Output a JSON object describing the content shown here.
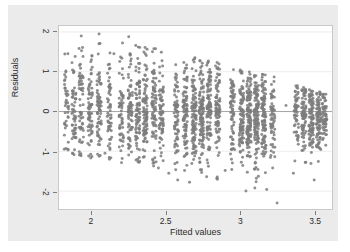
{
  "chart_data": {
    "type": "scatter",
    "title": "",
    "subtitle": "",
    "xlabel": "Fitted values",
    "ylabel": "Residuals",
    "xlim": [
      1.78,
      3.62
    ],
    "ylim": [
      -2.45,
      2.15
    ],
    "xticks": [
      2,
      2.5,
      3,
      3.5
    ],
    "xtick_labels": [
      "2",
      "2.5",
      "3",
      "3.5"
    ],
    "yticks": [
      2,
      1,
      0,
      -1,
      -2
    ],
    "ytick_labels": [
      "2",
      "1",
      "0",
      "-1",
      "-2"
    ],
    "grid": true,
    "grid_axis": "y",
    "legend": "none",
    "marker": {
      "shape": "circle",
      "color": "#7d7d7d",
      "size": 3.0,
      "opacity": 0.85
    },
    "reference_lines": [
      {
        "orientation": "horizontal",
        "value": 0,
        "color": "#9a9a9a"
      }
    ],
    "annotations": [
      "Residual spread fans downward: upper envelope declines from about 1.9 at fitted 2.0 to about 0.6 at fitted 3.55",
      "Points form discrete vertical bands at repeated fitted values",
      "Density is highest near residual 0; sparse outliers reach about -2.3"
    ],
    "n_points": 1850,
    "bands": [
      {
        "x": 1.83,
        "n": 40,
        "top": 1.55,
        "bottom": -1.05
      },
      {
        "x": 1.88,
        "n": 55,
        "top": 1.6,
        "bottom": -1.1
      },
      {
        "x": 1.93,
        "n": 60,
        "top": 1.7,
        "bottom": -1.15
      },
      {
        "x": 1.99,
        "n": 70,
        "top": 1.75,
        "bottom": -1.2
      },
      {
        "x": 2.05,
        "n": 70,
        "top": 1.8,
        "bottom": -1.2
      },
      {
        "x": 2.12,
        "n": 55,
        "top": 1.55,
        "bottom": -1.25
      },
      {
        "x": 2.2,
        "n": 60,
        "top": 1.8,
        "bottom": -1.3
      },
      {
        "x": 2.26,
        "n": 75,
        "top": 1.75,
        "bottom": -1.3
      },
      {
        "x": 2.31,
        "n": 85,
        "top": 1.7,
        "bottom": -1.35
      },
      {
        "x": 2.36,
        "n": 90,
        "top": 1.65,
        "bottom": -1.35
      },
      {
        "x": 2.42,
        "n": 80,
        "top": 1.6,
        "bottom": -1.4
      },
      {
        "x": 2.47,
        "n": 70,
        "top": 1.55,
        "bottom": -1.45
      },
      {
        "x": 2.57,
        "n": 75,
        "top": 1.45,
        "bottom": -1.5
      },
      {
        "x": 2.63,
        "n": 95,
        "top": 1.45,
        "bottom": -1.55
      },
      {
        "x": 2.69,
        "n": 110,
        "top": 1.4,
        "bottom": -1.6
      },
      {
        "x": 2.74,
        "n": 115,
        "top": 1.35,
        "bottom": -1.65
      },
      {
        "x": 2.79,
        "n": 105,
        "top": 1.3,
        "bottom": -1.7
      },
      {
        "x": 2.85,
        "n": 90,
        "top": 1.25,
        "bottom": -1.75
      },
      {
        "x": 2.95,
        "n": 70,
        "top": 1.15,
        "bottom": -1.55
      },
      {
        "x": 3.01,
        "n": 95,
        "top": 1.05,
        "bottom": -1.6
      },
      {
        "x": 3.06,
        "n": 120,
        "top": 1.0,
        "bottom": -1.75
      },
      {
        "x": 3.11,
        "n": 120,
        "top": 0.98,
        "bottom": -1.8
      },
      {
        "x": 3.16,
        "n": 100,
        "top": 0.95,
        "bottom": -1.7
      },
      {
        "x": 3.22,
        "n": 60,
        "top": 0.9,
        "bottom": -1.6
      },
      {
        "x": 3.38,
        "n": 55,
        "top": 0.68,
        "bottom": -1.3
      },
      {
        "x": 3.43,
        "n": 80,
        "top": 0.62,
        "bottom": -1.35
      },
      {
        "x": 3.48,
        "n": 95,
        "top": 0.58,
        "bottom": -1.4
      },
      {
        "x": 3.53,
        "n": 90,
        "top": 0.52,
        "bottom": -1.35
      },
      {
        "x": 3.57,
        "n": 60,
        "top": 0.45,
        "bottom": -1.2
      }
    ],
    "outliers": [
      {
        "x": 1.84,
        "y": 1.45
      },
      {
        "x": 1.93,
        "y": 1.9
      },
      {
        "x": 2.05,
        "y": 1.95
      },
      {
        "x": 2.09,
        "y": -1.05
      },
      {
        "x": 2.15,
        "y": 1.45
      },
      {
        "x": 2.25,
        "y": 1.88
      },
      {
        "x": 2.45,
        "y": -1.42
      },
      {
        "x": 2.52,
        "y": -1.55
      },
      {
        "x": 2.58,
        "y": -1.72
      },
      {
        "x": 2.66,
        "y": -1.78
      },
      {
        "x": 2.9,
        "y": -1.48
      },
      {
        "x": 3.04,
        "y": -2.0
      },
      {
        "x": 3.1,
        "y": -1.92
      },
      {
        "x": 3.18,
        "y": -1.96
      },
      {
        "x": 3.25,
        "y": -2.3
      },
      {
        "x": 3.31,
        "y": 0.15
      },
      {
        "x": 3.36,
        "y": -1.55
      },
      {
        "x": 3.5,
        "y": -1.72
      },
      {
        "x": 3.44,
        "y": -1.28
      },
      {
        "x": 2.12,
        "y": -1.2
      }
    ]
  },
  "axis": {
    "x_title": "Fitted values",
    "y_title": "Residuals"
  }
}
